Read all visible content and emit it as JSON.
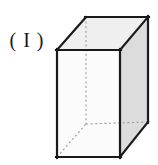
{
  "figure": {
    "label": "( I )",
    "label_name": "figure-label-roman-one",
    "caption": "",
    "shape": "rectangular-prism",
    "canvas": {
      "width": 158,
      "height": 165,
      "background": "#ffffff"
    },
    "colors": {
      "outline": "#1a1a1a",
      "hidden_edge": "#9a9a9a",
      "front_face_fill": "#fbfbfb",
      "top_face_fill": "#efefef",
      "right_face_fill": "#dcdcdc",
      "label_text": "#1a1a1a"
    },
    "stroke_widths": {
      "visible": 2.2,
      "hidden": 1.1
    },
    "hidden_edge_dash": "2,2.6",
    "vertices": {
      "front_top_left": [
        57,
        50
      ],
      "front_top_right": [
        120,
        50
      ],
      "front_bottom_right": [
        120,
        157
      ],
      "front_bottom_left": [
        57,
        157
      ],
      "back_top_left": [
        86,
        17
      ],
      "back_top_right": [
        148,
        17
      ],
      "back_bottom_right": [
        148,
        122
      ],
      "back_bottom_left": [
        86,
        124
      ]
    },
    "faces": [
      {
        "name": "front-face",
        "points": "57,50 120,50 120,157 57,157",
        "fill": "#fbfbfb"
      },
      {
        "name": "top-face",
        "points": "57,50 86,17 148,17 120,50",
        "fill": "#efefef"
      },
      {
        "name": "right-face",
        "points": "120,50 148,17 148,122 120,157",
        "fill": "#dcdcdc"
      }
    ],
    "visible_edges": [
      {
        "name": "front-top-edge",
        "from": [
          57,
          50
        ],
        "to": [
          120,
          50
        ]
      },
      {
        "name": "front-left-edge",
        "from": [
          57,
          50
        ],
        "to": [
          57,
          157
        ]
      },
      {
        "name": "front-right-edge",
        "from": [
          120,
          50
        ],
        "to": [
          120,
          157
        ]
      },
      {
        "name": "front-bottom-edge",
        "from": [
          57,
          157
        ],
        "to": [
          120,
          157
        ]
      },
      {
        "name": "top-left-receding-edge",
        "from": [
          57,
          50
        ],
        "to": [
          86,
          17
        ]
      },
      {
        "name": "top-back-edge",
        "from": [
          86,
          17
        ],
        "to": [
          148,
          17
        ]
      },
      {
        "name": "top-right-receding-edge",
        "from": [
          120,
          50
        ],
        "to": [
          148,
          17
        ]
      },
      {
        "name": "back-right-vertical-edge",
        "from": [
          148,
          17
        ],
        "to": [
          148,
          122
        ]
      },
      {
        "name": "bottom-right-receding-edge",
        "from": [
          120,
          157
        ],
        "to": [
          148,
          122
        ]
      }
    ],
    "hidden_edges": [
      {
        "name": "hidden-back-left-vertical-edge",
        "from": [
          86,
          17
        ],
        "to": [
          86,
          124
        ]
      },
      {
        "name": "hidden-bottom-back-edge",
        "from": [
          86,
          124
        ],
        "to": [
          148,
          122
        ]
      },
      {
        "name": "hidden-bottom-left-receding-edge",
        "from": [
          57,
          157
        ],
        "to": [
          86,
          124
        ]
      }
    ]
  }
}
